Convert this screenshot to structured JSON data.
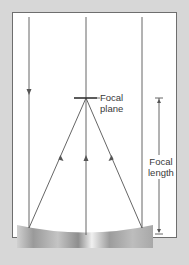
{
  "diagram": {
    "labels": {
      "focal_plane_line1": "Focal",
      "focal_plane_line2": "plane",
      "focal_length_line1": "Focal",
      "focal_length_line2": "length"
    },
    "elements": {
      "incoming_rays": 3,
      "reflected_rays": 3,
      "mirror": "concave mirror"
    },
    "colors": {
      "background": "#d7d7d7",
      "panel": "#ffffff",
      "line": "#555555",
      "text": "#3a3a3a"
    }
  }
}
